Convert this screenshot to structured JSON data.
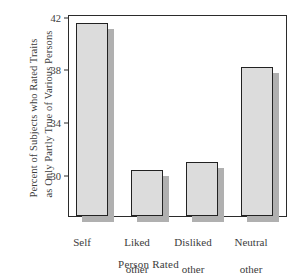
{
  "chart_data": {
    "type": "bar",
    "title": "",
    "categories": [
      "Self",
      "Liked other",
      "Disliked other",
      "Neutral other"
    ],
    "category_lines": [
      [
        "Self"
      ],
      [
        "Liked",
        "other"
      ],
      [
        "Disliked",
        "other"
      ],
      [
        "Neutral",
        "other"
      ]
    ],
    "values": [
      41.7,
      30.5,
      31.1,
      38.3
    ],
    "xlabel": "Person Rated",
    "ylabel_lines": [
      "Percent of Subjects who Rated Traits",
      "as Only Partly True of Various Persons"
    ],
    "ylabel": "Percent of Subjects who Rated Traits as Only Partly True of Various Persons",
    "ytick_labels": [
      "42",
      "38",
      "34",
      "30"
    ],
    "ytick_values": [
      42,
      38,
      34,
      30
    ],
    "ylim": [
      27.0,
      42.2
    ],
    "grid": false,
    "legend": false,
    "colors": {
      "bar_face": "#dcdcdc",
      "bar_edge": "#222222",
      "bar_shadow": "#b0b0b0",
      "frame": "#2b2b2b",
      "text": "#3c3c3c",
      "background": "#ffffff"
    }
  },
  "axis": {
    "y_line_1": "Percent of Subjects who Rated Traits",
    "y_line_2": "as Only Partly True of Various Persons",
    "x_title": "Person Rated"
  },
  "ticks": {
    "t0": "42",
    "t1": "38",
    "t2": "34",
    "t3": "30"
  },
  "cats": {
    "c0_l1": "Self",
    "c0_l2": "",
    "c1_l1": "Liked",
    "c1_l2": "other",
    "c2_l1": "Disliked",
    "c2_l2": "other",
    "c3_l1": "Neutral",
    "c3_l2": "other"
  }
}
